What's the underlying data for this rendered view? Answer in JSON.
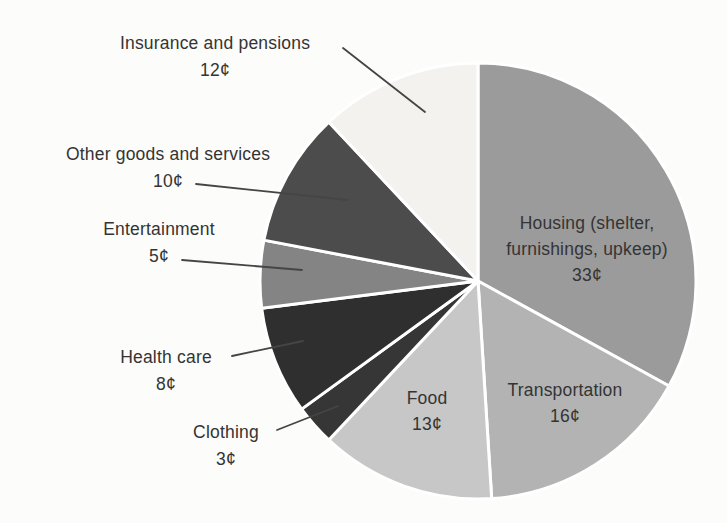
{
  "figure": {
    "background_color": "#fcfcfa",
    "text_color": "#343434",
    "divider_color": "#ffffff",
    "leader_line_color": "#454545"
  },
  "chart_data": {
    "type": "pie",
    "title": "",
    "total": 100,
    "value_suffix": "¢",
    "start_angle_deg": -90,
    "direction": "clockwise",
    "center": [
      478,
      281
    ],
    "radius": 218,
    "legend": "none",
    "slices": [
      {
        "id": "housing",
        "label": "Housing (shelter, furnishings, upkeep)",
        "value": 33,
        "color": "#9b9b9b",
        "display": [
          "Housing (shelter,",
          "furnishings, upkeep)",
          "33¢"
        ],
        "label_xy": [
          587,
          249
        ],
        "label_placement": "inside"
      },
      {
        "id": "transportation",
        "label": "Transportation",
        "value": 16,
        "color": "#b3b3b3",
        "display": [
          "Transportation",
          "16¢"
        ],
        "label_xy": [
          565,
          403
        ],
        "label_placement": "inside"
      },
      {
        "id": "food",
        "label": "Food",
        "value": 13,
        "color": "#c7c7c7",
        "display": [
          "Food",
          "13¢"
        ],
        "label_xy": [
          427,
          411
        ],
        "label_placement": "inside"
      },
      {
        "id": "clothing",
        "label": "Clothing",
        "value": 3,
        "color": "#363636",
        "display": [
          "Clothing",
          "3¢"
        ],
        "label_xy": [
          226,
          446
        ],
        "label_placement": "outside",
        "callout_line": [
          277,
          430,
          338,
          406
        ]
      },
      {
        "id": "health-care",
        "label": "Health care",
        "value": 8,
        "color": "#2f2f2f",
        "display": [
          "Health care",
          "8¢"
        ],
        "label_xy": [
          166,
          371
        ],
        "label_placement": "outside",
        "callout_line": [
          232,
          356,
          303,
          341
        ]
      },
      {
        "id": "entertainment",
        "label": "Entertainment",
        "value": 5,
        "color": "#848484",
        "display": [
          "Entertainment",
          "5¢"
        ],
        "label_xy": [
          159,
          243
        ],
        "label_placement": "outside",
        "callout_line": [
          182,
          260,
          302,
          270
        ]
      },
      {
        "id": "other-goods-services",
        "label": "Other goods and services",
        "value": 10,
        "color": "#4c4c4c",
        "display": [
          "Other goods and services",
          "10¢"
        ],
        "label_xy": [
          168,
          168
        ],
        "label_placement": "outside",
        "callout_line": [
          196,
          184,
          348,
          200
        ]
      },
      {
        "id": "insurance-pensions",
        "label": "Insurance and pensions",
        "value": 12,
        "color": "#f3f2ee",
        "display": [
          "Insurance and pensions",
          "12¢"
        ],
        "label_xy": [
          215,
          57
        ],
        "label_placement": "outside",
        "callout_line": [
          343,
          48,
          425,
          112
        ]
      }
    ]
  }
}
